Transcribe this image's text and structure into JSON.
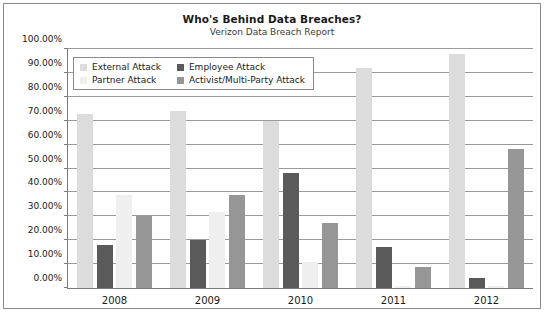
{
  "chart_data": {
    "type": "bar",
    "title": "Who's Behind Data Breaches?",
    "subtitle": "Verizon Data Breach Report",
    "xlabel": "",
    "ylabel": "",
    "categories": [
      "2008",
      "2009",
      "2010",
      "2011",
      "2012"
    ],
    "series": [
      {
        "name": "External Attack",
        "color": "#dcdcdc",
        "values": [
          73,
          74,
          70,
          92,
          98
        ]
      },
      {
        "name": "Employee Attack",
        "color": "#5a5a5a",
        "values": [
          18,
          20,
          48,
          17,
          4
        ]
      },
      {
        "name": "Partner Attack",
        "color": "#efefef",
        "values": [
          39,
          32,
          11,
          1,
          1
        ]
      },
      {
        "name": "Activist/Multi-Party Attack",
        "color": "#969696",
        "values": [
          30,
          39,
          27,
          9,
          58
        ]
      }
    ],
    "ylim": [
      0,
      100
    ],
    "ytick_values": [
      0,
      10,
      20,
      30,
      40,
      50,
      60,
      70,
      80,
      90,
      100
    ],
    "ytick_labels": [
      "0.00%",
      "10.00%",
      "20.00%",
      "30.00%",
      "40.00%",
      "50.00%",
      "60.00%",
      "70.00%",
      "80.00%",
      "90.00%",
      "100.00%"
    ],
    "grid": true,
    "legend_position": "top-left"
  }
}
